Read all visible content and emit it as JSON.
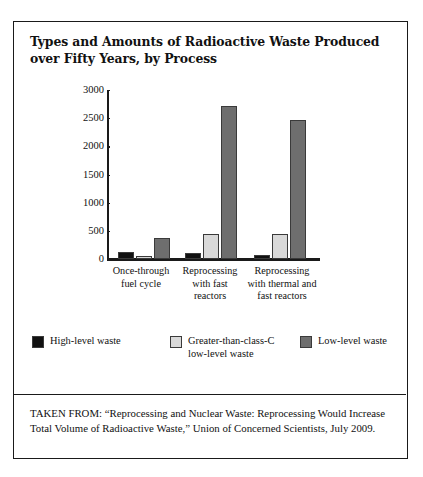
{
  "figure": {
    "title": "Types and Amounts of Radioactive Waste Produced over Fifty Years, by Process",
    "source_note": "TAKEN FROM: “Reprocessing and Nuclear Waste: Reprocessing Would Increase Total Volume of Radioactive Waste,” Union of Concerned Scientists, July 2009."
  },
  "chart_data": {
    "type": "bar",
    "title": "Types and Amounts of Radioactive Waste Produced over Fifty Years, by Process",
    "xlabel": "",
    "ylabel": "",
    "ylim": [
      0,
      3000
    ],
    "yticks": [
      0,
      500,
      1000,
      1500,
      2000,
      2500,
      3000
    ],
    "ytick_labels": [
      "0",
      "500",
      "1000",
      "1500",
      "2000",
      "2500",
      "3000"
    ],
    "grid": false,
    "legend_position": "bottom",
    "categories": [
      "Once-through fuel cycle",
      "Reprocessing with fast reactors",
      "Reprocessing with thermal and fast reactors"
    ],
    "category_lines": [
      [
        "Once-through",
        "fuel cycle"
      ],
      [
        "Reprocessing",
        "with fast",
        "reactors"
      ],
      [
        "Reprocessing",
        "with thermal and",
        "fast reactors"
      ]
    ],
    "series": [
      {
        "name": "High-level waste",
        "color": "#111111",
        "values": [
          125,
          110,
          70
        ]
      },
      {
        "name": "Greater-than-class-C low-level waste",
        "color": "#d9d9d9",
        "values": [
          50,
          445,
          440
        ]
      },
      {
        "name": "Low-level waste",
        "color": "#6e6e6e",
        "values": [
          375,
          2715,
          2465
        ]
      }
    ]
  },
  "legend": {
    "items": [
      {
        "label": "High-level waste",
        "label_line2": "",
        "color": "#111111"
      },
      {
        "label": "Greater-than-class-C",
        "label_line2": "low-level waste",
        "color": "#d9d9d9"
      },
      {
        "label": "Low-level waste",
        "label_line2": "",
        "color": "#6e6e6e"
      }
    ]
  }
}
